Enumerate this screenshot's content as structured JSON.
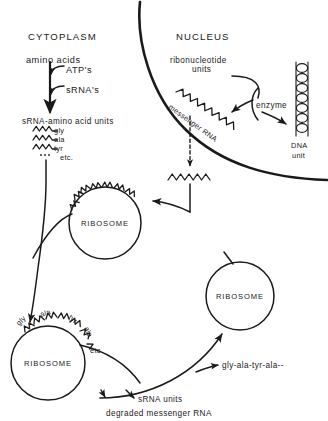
{
  "diagram": {
    "ink_color": "#1a1a1a",
    "background_color": "#ffffff"
  },
  "cytoplasm": {
    "section_label": "CYTOPLASM",
    "amino_acids_label": "amino acids",
    "cofactor_1": "ATP's",
    "cofactor_2": "sRNA's",
    "srna_units_label": "sRNA-amino acid units",
    "srna_items": [
      {
        "label": "gly"
      },
      {
        "label": "ala"
      },
      {
        "label": "tyr"
      }
    ],
    "etc_label": "etc."
  },
  "nucleus": {
    "section_label": "NUCLEUS",
    "ribonucleotide_label_line1": "ribonucleotide",
    "ribonucleotide_label_line2": "units",
    "enzyme_label": "enzyme",
    "dna_label_line1": "DNA",
    "dna_label_line2": "unit",
    "messenger_rna_label": "messenger RNA"
  },
  "ribosomes": [
    {
      "label": "RIBOSOME",
      "position": "upper-left"
    },
    {
      "label": "RIBOSOME",
      "position": "center-right"
    },
    {
      "label": "RIBOSOME",
      "position": "lower-left"
    }
  ],
  "peptide_chain": {
    "residues": [
      {
        "label": "gly"
      },
      {
        "label": "ala"
      },
      {
        "label": "tyr"
      },
      {
        "label": "ala"
      }
    ],
    "etc_label": "etc."
  },
  "products": {
    "polypeptide_label": "gly-ala-tyr-ala--",
    "srna_units_label": "sRNA units",
    "degraded_mrna_label": "degraded messenger RNA"
  }
}
